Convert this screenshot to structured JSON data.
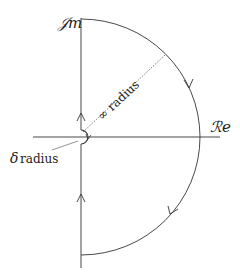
{
  "diagram": {
    "type": "nyquist-contour",
    "axes": {
      "imaginary_label": "𝒥m",
      "real_label": "ℛe"
    },
    "annotations": {
      "infinity_radius": "∞ radius",
      "delta_radius_symbol": "δ",
      "delta_radius_text": "radius"
    },
    "colors": {
      "line": "#333333",
      "background": "#ffffff"
    }
  }
}
